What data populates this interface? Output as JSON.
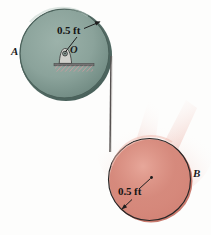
{
  "figure": {
    "kind": "engineering-mechanics-diagram",
    "background_color": "#fdfdfc"
  },
  "pulley_a": {
    "label": "A",
    "center_label": "O",
    "radius_label": "0.5 ft",
    "fill_color": "#8ba39b",
    "edge_color": "#4f6660",
    "rim_color": "#7e958e",
    "center": {
      "x": 66,
      "y": 55
    },
    "radius_px": 46
  },
  "cylinder_b": {
    "label": "B",
    "radius_label": "0.5 ft",
    "fill_color": "#dd9184",
    "edge_color": "#2b2b2b",
    "rim_color": "#c9786d",
    "center": {
      "x": 150,
      "y": 180
    },
    "radius_px": 42
  },
  "cord": {
    "name": "cord",
    "color": "#55504e",
    "from": {
      "x": 111,
      "y": 58
    },
    "to": {
      "x": 110,
      "y": 152
    }
  },
  "support": {
    "name": "fixed-support",
    "bar_color": "#6f6f6f",
    "hatch_color": "#d79aa0"
  }
}
